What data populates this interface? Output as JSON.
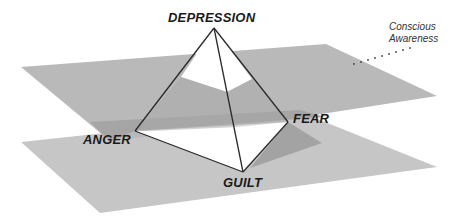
{
  "diagram": {
    "vertices": {
      "apex": "DEPRESSION",
      "left": "ANGER",
      "right": "FEAR",
      "front": "GUILT"
    },
    "annotation": {
      "line1": "Conscious",
      "line2": "Awareness"
    }
  },
  "colors": {
    "plane_upper": "#b8b8b8",
    "plane_lower": "#c4c4c4",
    "plane_shadow": "#9a9a9a",
    "pyramid_face": "#ffffff",
    "edge": "#2a2a2a",
    "text": "#1a1a1a"
  }
}
